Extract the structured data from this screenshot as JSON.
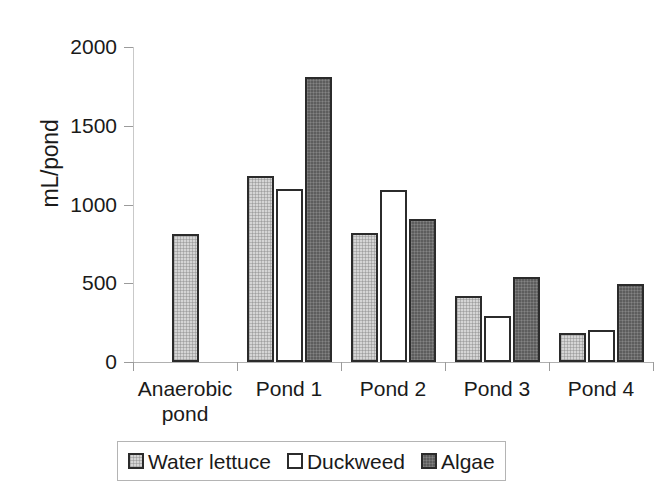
{
  "chart_data": {
    "type": "bar",
    "title": "",
    "xlabel": "",
    "ylabel": "mL/pond",
    "ylim": [
      0,
      2000
    ],
    "ytick_labels": [
      "2000",
      "1500",
      "1000",
      "500",
      "0"
    ],
    "ytick_values": [
      2000,
      1500,
      1000,
      500,
      0
    ],
    "grid": false,
    "legend_position": "bottom",
    "categories": [
      "Anaerobic pond",
      "Pond 1",
      "Pond 2",
      "Pond 3",
      "Pond 4"
    ],
    "category_lines": [
      [
        "Anaerobic",
        "pond"
      ],
      [
        "Pond 1"
      ],
      [
        "Pond 2"
      ],
      [
        "Pond 3"
      ],
      [
        "Pond 4"
      ]
    ],
    "series": [
      {
        "name": "Water lettuce",
        "color": "#d5d5d5",
        "values": [
          810,
          1180,
          820,
          420,
          185
        ]
      },
      {
        "name": "Duckweed",
        "color": "#ffffff",
        "values": [
          null,
          1100,
          1095,
          290,
          205
        ]
      },
      {
        "name": "Algae",
        "color": "#5d5d5d",
        "values": [
          null,
          1810,
          905,
          540,
          495
        ]
      }
    ]
  },
  "legend": {
    "items": [
      {
        "label": "Water lettuce",
        "swatch": "legend-swatch-water-lettuce"
      },
      {
        "label": "Duckweed",
        "swatch": "legend-swatch-duckweed"
      },
      {
        "label": "Algae",
        "swatch": "legend-swatch-algae"
      }
    ]
  },
  "colors": {
    "series_water_lettuce": "#d5d5d5",
    "series_duckweed": "#ffffff",
    "series_algae": "#5d5d5d",
    "bar_border": "#2b2b2b",
    "axis": "#b0b0b0",
    "text": "#1a1a1a",
    "background": "#ffffff"
  }
}
